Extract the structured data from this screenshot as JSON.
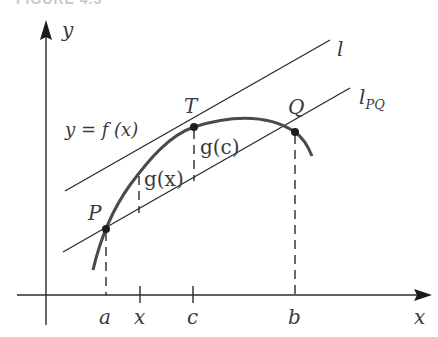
{
  "header": {
    "cut_title": "FIGURE 4.5"
  },
  "labels": {
    "y_axis": "y",
    "x_axis": "x",
    "tangent_line": "l",
    "secant_line_base": "l",
    "secant_line_sub": "PQ",
    "function_label": "y = f (x)",
    "point_P": "P",
    "point_T": "T",
    "point_Q": "Q",
    "g_x": "g(x)",
    "g_c": "g(c)",
    "tick_a": "a",
    "tick_x": "x",
    "tick_c": "c",
    "tick_b": "b"
  },
  "colors": {
    "curve": "#4a4a4a",
    "lines": "#2a2a2a",
    "text": "#3a3a3a"
  }
}
